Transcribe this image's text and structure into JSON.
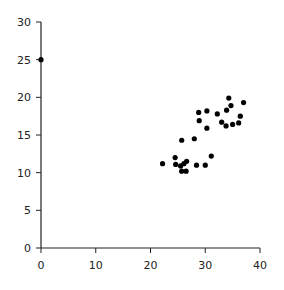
{
  "chart_data": {
    "type": "scatter",
    "title": "",
    "xlabel": "",
    "ylabel": "",
    "xlim": [
      0,
      40
    ],
    "ylim": [
      0,
      30
    ],
    "x_ticks": [
      0,
      10,
      20,
      30,
      40
    ],
    "y_ticks": [
      0,
      5,
      10,
      15,
      20,
      25,
      30
    ],
    "grid": false,
    "legend": null,
    "marker_color": "#000000",
    "series": [
      {
        "name": "points",
        "points": [
          {
            "x": 0.0,
            "y": 25.0
          },
          {
            "x": 22.2,
            "y": 11.2
          },
          {
            "x": 24.5,
            "y": 12.0
          },
          {
            "x": 24.6,
            "y": 11.1
          },
          {
            "x": 25.5,
            "y": 10.9
          },
          {
            "x": 26.1,
            "y": 11.2
          },
          {
            "x": 26.6,
            "y": 11.5
          },
          {
            "x": 25.7,
            "y": 10.2
          },
          {
            "x": 26.5,
            "y": 10.2
          },
          {
            "x": 28.4,
            "y": 11.0
          },
          {
            "x": 30.0,
            "y": 11.0
          },
          {
            "x": 31.1,
            "y": 12.2
          },
          {
            "x": 25.7,
            "y": 14.3
          },
          {
            "x": 28.0,
            "y": 14.5
          },
          {
            "x": 28.8,
            "y": 18.0
          },
          {
            "x": 30.3,
            "y": 18.2
          },
          {
            "x": 28.9,
            "y": 16.9
          },
          {
            "x": 30.3,
            "y": 15.9
          },
          {
            "x": 32.2,
            "y": 17.8
          },
          {
            "x": 34.3,
            "y": 19.9
          },
          {
            "x": 34.7,
            "y": 18.9
          },
          {
            "x": 33.9,
            "y": 18.3
          },
          {
            "x": 37.0,
            "y": 19.3
          },
          {
            "x": 36.4,
            "y": 17.5
          },
          {
            "x": 33.0,
            "y": 16.7
          },
          {
            "x": 33.8,
            "y": 16.2
          },
          {
            "x": 35.0,
            "y": 16.4
          },
          {
            "x": 36.1,
            "y": 16.6
          }
        ]
      }
    ]
  },
  "layout": {
    "x0_px": 41,
    "x1_px": 260,
    "y0_px": 248,
    "y1_px": 22
  }
}
